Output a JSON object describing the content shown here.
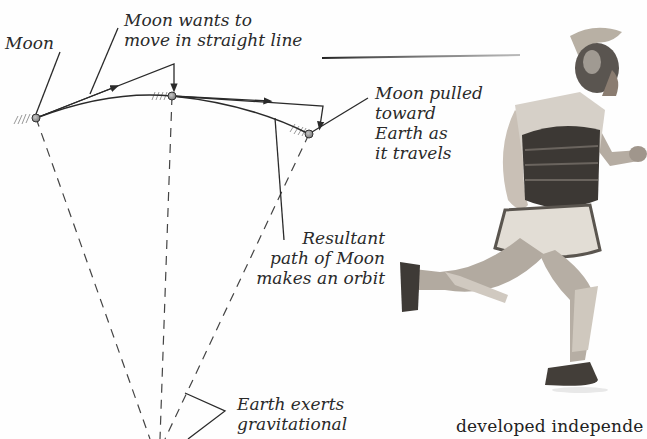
{
  "figure": {
    "labels": {
      "moon": "Moon",
      "wants_line1": "Moon wants to",
      "wants_line2": "move in straight line",
      "pulled_line1": "Moon pulled",
      "pulled_line2": "toward",
      "pulled_line3": "Earth as",
      "pulled_line4": "it travels",
      "resultant_line1": "Resultant",
      "resultant_line2": "path of Moon",
      "resultant_line3": "makes an orbit",
      "earth_line1": "Earth exerts",
      "earth_line2": "gravitational"
    },
    "colors": {
      "line": "#2a2a2a",
      "moon_fill": "#9a9a9a",
      "text": "#2a2a2a"
    }
  },
  "photo": {
    "subject": "running Roman soldier with spear",
    "icon": "soldier-illustration"
  },
  "body": {
    "text_fragment": "developed independe"
  }
}
